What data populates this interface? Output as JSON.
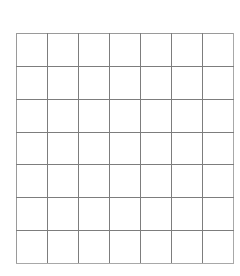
{
  "page": {
    "background_color": "#ffffff",
    "width": 240,
    "height": 276
  },
  "grid": {
    "name": "blank-grid",
    "rows": 7,
    "columns": 7,
    "cell_count": 49,
    "line_color": "#7d7d7d",
    "border_color": "#9a9a9a",
    "cell_fill": "#ffffff",
    "cell_width_px": 30,
    "cell_height_px": 32,
    "origin_x_px": 16,
    "origin_y_px": 33,
    "total_width_px": 210,
    "total_height_px": 223,
    "cells": [
      [
        "",
        "",
        "",
        "",
        "",
        "",
        ""
      ],
      [
        "",
        "",
        "",
        "",
        "",
        "",
        ""
      ],
      [
        "",
        "",
        "",
        "",
        "",
        "",
        ""
      ],
      [
        "",
        "",
        "",
        "",
        "",
        "",
        ""
      ],
      [
        "",
        "",
        "",
        "",
        "",
        "",
        ""
      ],
      [
        "",
        "",
        "",
        "",
        "",
        "",
        ""
      ],
      [
        "",
        "",
        "",
        "",
        "",
        "",
        ""
      ]
    ]
  }
}
